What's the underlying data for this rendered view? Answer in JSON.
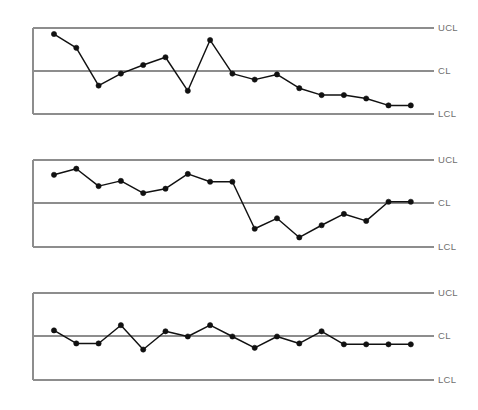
{
  "figure": {
    "title": "",
    "width": 478,
    "height": 410,
    "background": "#ffffff",
    "line_color": "#111111",
    "marker_color": "#111111",
    "limit_color": "#8d8d8d",
    "label_color": "#6f6f6f"
  },
  "labels": {
    "ucl": "UCL",
    "cl": "CL",
    "lcl": "LCL"
  },
  "chart_data": [
    {
      "type": "line",
      "title": "Control chart 1 - downward trend with spike",
      "xlabel": "",
      "ylabel": "",
      "grid": false,
      "legend": "none",
      "ylim": [
        0,
        1
      ],
      "control_limits": {
        "UCL": 1.0,
        "CL": 0.5,
        "LCL": 0.0
      },
      "x": [
        1,
        2,
        3,
        4,
        5,
        6,
        7,
        8,
        9,
        10,
        11,
        12,
        13,
        14,
        15,
        16,
        17
      ],
      "values": [
        0.93,
        0.77,
        0.33,
        0.47,
        0.57,
        0.66,
        0.27,
        0.86,
        0.47,
        0.4,
        0.46,
        0.3,
        0.22,
        0.22,
        0.18,
        0.1,
        0.1
      ]
    },
    {
      "type": "line",
      "title": "Control chart 2 - level shift downward",
      "xlabel": "",
      "ylabel": "",
      "grid": false,
      "legend": "none",
      "ylim": [
        0,
        1
      ],
      "control_limits": {
        "UCL": 1.0,
        "CL": 0.5,
        "LCL": 0.0
      },
      "x": [
        1,
        2,
        3,
        4,
        5,
        6,
        7,
        8,
        9,
        10,
        11,
        12,
        13,
        14,
        15,
        16,
        17
      ],
      "values": [
        0.83,
        0.9,
        0.7,
        0.76,
        0.62,
        0.67,
        0.84,
        0.75,
        0.75,
        0.21,
        0.33,
        0.11,
        0.25,
        0.38,
        0.3,
        0.52,
        0.52
      ]
    },
    {
      "type": "line",
      "title": "Control chart 3 - stable process around centre line",
      "xlabel": "",
      "ylabel": "",
      "grid": false,
      "legend": "none",
      "ylim": [
        0,
        1
      ],
      "control_limits": {
        "UCL": 1.0,
        "CL": 0.5,
        "LCL": 0.0
      },
      "x": [
        1,
        2,
        3,
        4,
        5,
        6,
        7,
        8,
        9,
        10,
        11,
        12,
        13,
        14,
        15,
        16,
        17
      ],
      "values": [
        0.57,
        0.42,
        0.42,
        0.63,
        0.35,
        0.56,
        0.5,
        0.63,
        0.5,
        0.37,
        0.5,
        0.42,
        0.56,
        0.41,
        0.41,
        0.41,
        0.41
      ]
    }
  ]
}
